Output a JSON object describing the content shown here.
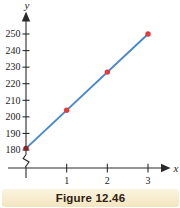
{
  "figure": {
    "caption": "Figure 12.46"
  },
  "chart_data": {
    "type": "scatter",
    "title": "",
    "xlabel": "x",
    "ylabel": "y",
    "x_ticks": [
      1,
      2,
      3
    ],
    "y_ticks": [
      180,
      190,
      200,
      210,
      220,
      230,
      240,
      250
    ],
    "xlim": [
      0,
      3.5
    ],
    "ylim_shown": [
      180,
      250
    ],
    "axis_break_on_y": true,
    "grid": false,
    "legend": false,
    "points": [
      {
        "x": 0,
        "y": 181
      },
      {
        "x": 1,
        "y": 204
      },
      {
        "x": 2,
        "y": 227
      },
      {
        "x": 3,
        "y": 250
      }
    ],
    "trend_line": {
      "x1": 0,
      "y1": 181,
      "x2": 3,
      "y2": 250
    },
    "colors": {
      "line": "#4a87cd",
      "point": "#e23b3b",
      "first_point": "#8a2626",
      "axis": "#2a2a2a",
      "tick_text": "#222222",
      "caption_bg_top": "#fbf4de",
      "caption_bg_bottom": "#f3e5c0",
      "caption_text": "#2e2014"
    }
  }
}
